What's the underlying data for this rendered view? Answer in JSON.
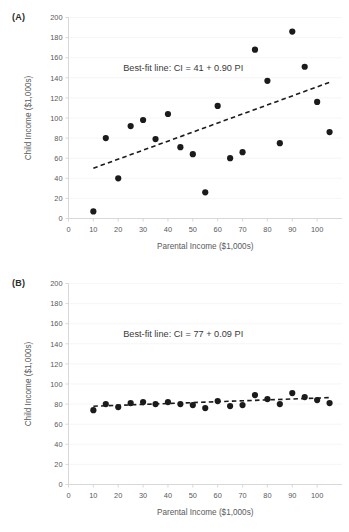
{
  "figure": {
    "panels": [
      {
        "id": "A",
        "label": "(A)",
        "annotation": "Best-fit line: CI = 41 + 0.90 PI"
      },
      {
        "id": "B",
        "label": "(B)",
        "annotation": "Best-fit line: CI = 77 + 0.09 PI"
      }
    ]
  },
  "chart_data": [
    {
      "type": "scatter",
      "panel": "A",
      "title": "",
      "xlabel": "Parental Income ($1,000s)",
      "ylabel": "Child Income ($1,000s)",
      "xlim": [
        0,
        110
      ],
      "ylim": [
        0,
        200
      ],
      "xticks": [
        0,
        10,
        20,
        30,
        40,
        50,
        60,
        70,
        80,
        90,
        100
      ],
      "yticks": [
        0,
        20,
        40,
        60,
        80,
        100,
        120,
        140,
        160,
        180,
        200
      ],
      "grid": true,
      "grid_axis": "y",
      "legend": "none",
      "annotations": [
        {
          "text": "Best-fit line: CI = 41 + 0.90 PI",
          "x": 22,
          "y": 147
        }
      ],
      "point_color": "#1b1b1b",
      "fit_line_color": "#1b1b1b",
      "fit_line_style": "dashed",
      "fit_line": {
        "intercept": 41,
        "slope": 0.9,
        "equation": "CI = 41 + 0.90 PI",
        "x_start": 10,
        "x_end": 105
      },
      "x": [
        10,
        15,
        20,
        25,
        30,
        35,
        40,
        45,
        50,
        55,
        60,
        65,
        70,
        75,
        80,
        85,
        90,
        95,
        100,
        105
      ],
      "y": [
        7,
        80,
        40,
        92,
        98,
        79,
        104,
        71,
        64,
        26,
        112,
        60,
        66,
        168,
        137,
        75,
        186,
        151,
        116,
        86
      ]
    },
    {
      "type": "scatter",
      "panel": "B",
      "title": "",
      "xlabel": "Parental Income ($1,000s)",
      "ylabel": "Child Income ($1,000s)",
      "xlim": [
        0,
        110
      ],
      "ylim": [
        0,
        200
      ],
      "xticks": [
        0,
        10,
        20,
        30,
        40,
        50,
        60,
        70,
        80,
        90,
        100
      ],
      "yticks": [
        0,
        20,
        40,
        60,
        80,
        100,
        120,
        140,
        160,
        180,
        200
      ],
      "grid": true,
      "grid_axis": "y",
      "legend": "none",
      "annotations": [
        {
          "text": "Best-fit line: CI = 77 + 0.09 PI",
          "x": 22,
          "y": 147
        }
      ],
      "point_color": "#1b1b1b",
      "fit_line_color": "#1b1b1b",
      "fit_line_style": "dashed",
      "fit_line": {
        "intercept": 77,
        "slope": 0.09,
        "equation": "CI = 77 + 0.09 PI",
        "x_start": 10,
        "x_end": 105
      },
      "x": [
        10,
        15,
        20,
        25,
        30,
        35,
        40,
        45,
        50,
        55,
        60,
        65,
        70,
        75,
        80,
        85,
        90,
        95,
        100,
        105
      ],
      "y": [
        74,
        80,
        77,
        81,
        82,
        80,
        82,
        80,
        79,
        76,
        83,
        78,
        79,
        89,
        85,
        80,
        91,
        87,
        84,
        81
      ]
    }
  ]
}
